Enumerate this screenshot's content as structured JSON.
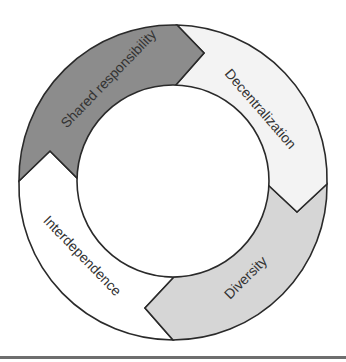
{
  "diagram": {
    "type": "cycle",
    "segments": [
      {
        "label": "Shared responsibility",
        "fill": "#8c8c8c"
      },
      {
        "label": "Decentralization",
        "fill": "#f3f3f3"
      },
      {
        "label": "Diversity",
        "fill": "#d6d6d6"
      },
      {
        "label": "Interdependence",
        "fill": "#ffffff"
      }
    ],
    "center": {
      "fill": "#ffffff"
    }
  }
}
